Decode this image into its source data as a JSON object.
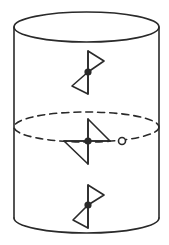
{
  "diagram": {
    "colors": {
      "stroke": "#2a2a2a",
      "background": "#ffffff"
    },
    "cylinder": {
      "left_x": 14,
      "right_x": 159,
      "top_ellipse": {
        "cx": 86.5,
        "cy": 27,
        "rx": 72.5,
        "ry": 15
      },
      "bottom_y": 218,
      "bottom_arc_depth": 15
    },
    "cross_section": {
      "cx": 86.5,
      "cy": 127,
      "rx": 72.5,
      "ry": 15,
      "style": "dashed"
    },
    "marker": {
      "type": "open-circle",
      "cx": 122,
      "cy": 141,
      "r": 3.5
    },
    "symbols": [
      {
        "id": "top",
        "type": "bowtie",
        "center": [
          88,
          72
        ]
      },
      {
        "id": "middle",
        "type": "rotated-bowtie",
        "center": [
          88,
          141
        ]
      },
      {
        "id": "bottom",
        "type": "bowtie",
        "center": [
          88,
          205
        ]
      }
    ]
  }
}
